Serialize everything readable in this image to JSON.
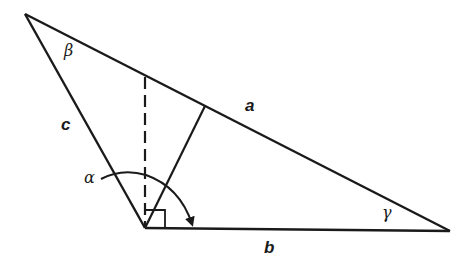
{
  "diagram": {
    "type": "triangle-geometry",
    "stroke_color": "#1a1a1a",
    "background": "#ffffff",
    "vertices": {
      "top": [
        25,
        14
      ],
      "bottom_left": [
        145,
        228
      ],
      "right": [
        450,
        231
      ]
    },
    "labels": {
      "side_a": "a",
      "side_b": "b",
      "side_c": "c",
      "angle_alpha": "α",
      "angle_beta": "β",
      "angle_gamma": "γ"
    },
    "elements": [
      "triangle sides a, b, c",
      "dashed altitude from bottom-left vertex to side a",
      "solid line from bottom-left vertex to side a",
      "right-angle marker at bottom-left vertex",
      "arc with arrow marking angle alpha"
    ]
  }
}
